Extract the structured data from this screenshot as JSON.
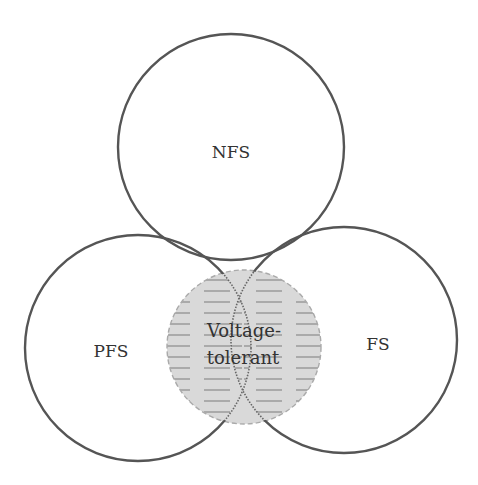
{
  "diagram": {
    "type": "venn",
    "sets": [
      {
        "id": "nfs",
        "label": "NFS"
      },
      {
        "id": "pfs",
        "label": "PFS"
      },
      {
        "id": "fs",
        "label": "FS"
      }
    ],
    "overlap": {
      "line1": "Voltage-",
      "line2": "tolerant"
    },
    "colors": {
      "circle_stroke": "#555555",
      "overlap_fill": "#d6d6d6",
      "hatch": "#8a8a8a",
      "dashed": "#aaaaaa"
    }
  }
}
